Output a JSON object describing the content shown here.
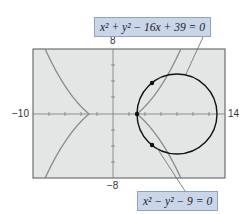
{
  "graph": {
    "window": {
      "xmin": -10,
      "xmax": 14,
      "ymin": -8,
      "ymax": 8
    },
    "tick_labels": {
      "xmin": "−10",
      "xmax": "14",
      "ymax": "8",
      "ymin": "−8"
    },
    "colors": {
      "background": "#e4e6e6",
      "frame": "#555555",
      "circle": "#111111",
      "hyperbola": "#8a8a8a",
      "label_box": "#c9d6ea"
    }
  },
  "equations": {
    "circle": "x² + y² − 16x + 39 = 0",
    "hyperbola": "x² − y² − 9 = 0"
  },
  "intersection_points": [
    {
      "x": 3,
      "y": 0
    },
    {
      "x": 4.87,
      "y": 3.83
    },
    {
      "x": 4.87,
      "y": -3.83
    }
  ]
}
